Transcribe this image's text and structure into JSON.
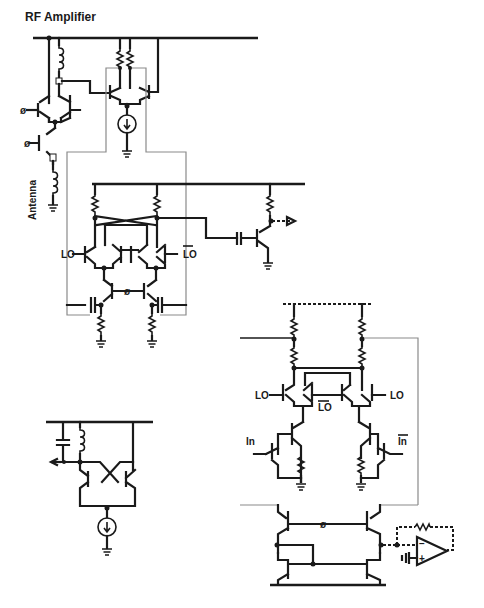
{
  "title": "RF Amplifier",
  "labels": {
    "antenna": "Antenna",
    "lo": "LO",
    "lo_bar": "LO",
    "in": "In",
    "in_bar": "In",
    "opamp_minus": "−",
    "opamp_plus": "+"
  },
  "sections": [
    {
      "name": "rf-amplifier",
      "caption": "RF Amplifier"
    },
    {
      "name": "gilbert-mixer",
      "caption": ""
    },
    {
      "name": "output-buffer",
      "caption": ""
    },
    {
      "name": "lc-oscillator",
      "caption": ""
    },
    {
      "name": "stacked-mixer-with-opamp",
      "caption": ""
    }
  ],
  "colors": {
    "ink": "#1a1a1a",
    "guide": "#8a8a8a",
    "background": "#ffffff"
  }
}
